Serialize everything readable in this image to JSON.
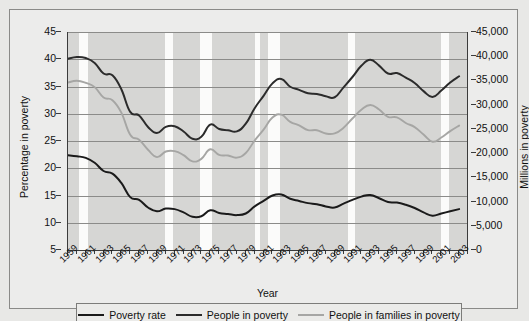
{
  "axes": {
    "ylabel_left": "Percentage in poverty",
    "ylabel_right": "Millions in poverty",
    "xlabel": "Year",
    "yticks_left": [
      "45",
      "40",
      "35",
      "30",
      "25",
      "20",
      "15",
      "10",
      "5"
    ],
    "yticks_right": [
      "45,000",
      "40,000",
      "35,000",
      "30,000",
      "25,000",
      "20,000",
      "15,000",
      "10,000",
      "5,000",
      "0"
    ],
    "xticks": [
      "1959",
      "1961",
      "1963",
      "1965",
      "1967",
      "1969",
      "1971",
      "1973",
      "1975",
      "1977",
      "1979",
      "1981",
      "1983",
      "1985",
      "1987",
      "1989",
      "1991",
      "1993",
      "1995",
      "1997",
      "1999",
      "2001",
      "2003"
    ]
  },
  "legend": {
    "items": [
      {
        "label": "Poverty rate",
        "color": "#1a1a1a"
      },
      {
        "label": "People in poverty",
        "color": "#2b2b2b"
      },
      {
        "label": "People in families in poverty",
        "color": "#a6a6a4"
      }
    ]
  },
  "colors": {
    "plot_bg": "#d6d6d4",
    "page_bg": "#ececeb",
    "gridline": "#8b8b89",
    "axis": "#3b3b3b",
    "recession_band": "#fbfbfa",
    "series_dark": "#1a1a1a",
    "series_gray": "#a6a6a4"
  },
  "chart_data": {
    "type": "line",
    "title": "",
    "xlabel": "Year",
    "ylabel": "Percentage in poverty",
    "ylabel_secondary": "Millions in poverty",
    "ylim": [
      5,
      45
    ],
    "ylim_secondary": [
      0,
      45000
    ],
    "xlim": [
      1959,
      2004
    ],
    "grid": true,
    "legend_position": "bottom",
    "x": [
      1959,
      1960,
      1961,
      1962,
      1963,
      1964,
      1965,
      1966,
      1967,
      1968,
      1969,
      1970,
      1971,
      1972,
      1973,
      1974,
      1975,
      1976,
      1977,
      1978,
      1979,
      1980,
      1981,
      1982,
      1983,
      1984,
      1985,
      1986,
      1987,
      1988,
      1989,
      1990,
      1991,
      1992,
      1993,
      1994,
      1995,
      1996,
      1997,
      1998,
      1999,
      2000,
      2001,
      2002,
      2003
    ],
    "series": [
      {
        "name": "Poverty rate",
        "axis": "left",
        "unit": "percent",
        "color": "#1a1a1a",
        "values": [
          22.4,
          22.2,
          21.9,
          21.0,
          19.5,
          19.0,
          17.3,
          14.7,
          14.2,
          12.8,
          12.1,
          12.6,
          12.5,
          11.9,
          11.1,
          11.2,
          12.3,
          11.8,
          11.6,
          11.4,
          11.7,
          13.0,
          14.0,
          15.0,
          15.2,
          14.4,
          14.0,
          13.6,
          13.4,
          13.0,
          12.8,
          13.5,
          14.2,
          14.8,
          15.1,
          14.5,
          13.8,
          13.7,
          13.3,
          12.7,
          11.9,
          11.3,
          11.7,
          12.1,
          12.5
        ]
      },
      {
        "name": "People in poverty",
        "axis": "right",
        "unit": "thousands",
        "color": "#2b2b2b",
        "values": [
          39490,
          39851,
          39628,
          38625,
          36436,
          36055,
          33185,
          28510,
          27769,
          25389,
          24147,
          25420,
          25559,
          24460,
          22973,
          23370,
          25877,
          24975,
          24720,
          24497,
          26072,
          29272,
          31822,
          34398,
          35303,
          33700,
          33064,
          32370,
          32221,
          31745,
          31528,
          33585,
          35708,
          38014,
          39265,
          38059,
          36425,
          36529,
          35574,
          34476,
          32791,
          31581,
          32907,
          34570,
          35861
        ]
      },
      {
        "name": "People in families in poverty",
        "axis": "right",
        "unit": "thousands",
        "color": "#a6a6a4",
        "values": [
          34562,
          34925,
          34509,
          33623,
          31498,
          30912,
          28358,
          23809,
          22771,
          20695,
          19175,
          20330,
          20405,
          19577,
          18299,
          18817,
          20789,
          19632,
          19505,
          19062,
          20033,
          22601,
          24850,
          27349,
          27933,
          26458,
          25729,
          24754,
          24725,
          24048,
          24066,
          25232,
          27143,
          28961,
          29927,
          28985,
          27501,
          27376,
          26217,
          25370,
          23830,
          22347,
          23215,
          24534,
          25684
        ]
      }
    ],
    "recession_bands": [
      {
        "start": 1960.2,
        "end": 1961.2
      },
      {
        "start": 1969.9,
        "end": 1970.8
      },
      {
        "start": 1973.9,
        "end": 1975.2
      },
      {
        "start": 1980.0,
        "end": 1980.6
      },
      {
        "start": 1981.5,
        "end": 1982.8
      },
      {
        "start": 1990.5,
        "end": 1991.3
      },
      {
        "start": 2001.0,
        "end": 2001.9
      }
    ]
  }
}
